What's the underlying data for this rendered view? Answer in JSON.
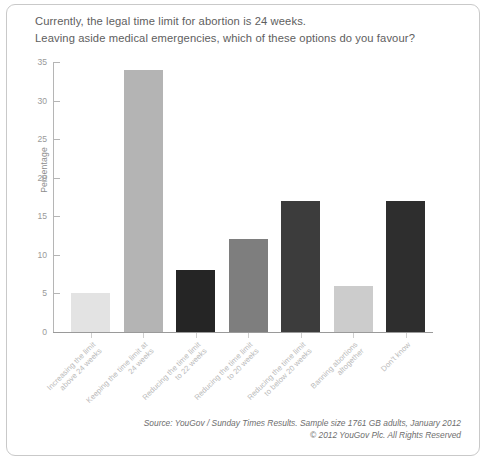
{
  "question": {
    "line1": "Currently, the legal time limit for abortion is 24 weeks.",
    "line2": "Leaving aside medical emergencies, which of these options do you favour?"
  },
  "footer": {
    "source": "Source: YouGov / Sunday Times Results. Sample size 1761 GB adults, January 2012",
    "copyright": "© 2012 YouGov Plc. All Rights Reserved"
  },
  "chart_data": {
    "type": "bar",
    "title": "Currently, the legal time limit for abortion is 24 weeks. Leaving aside medical emergencies, which of these options do you favour?",
    "xlabel": "",
    "ylabel": "Percentage",
    "ylim": [
      0,
      35
    ],
    "yticks": [
      0,
      5,
      10,
      15,
      20,
      25,
      30,
      35
    ],
    "ytick_labels": [
      "0",
      "5",
      "10",
      "15",
      "20",
      "25",
      "30",
      "35"
    ],
    "grid": false,
    "legend": "none",
    "categories": [
      "Increasing the limit above 24 weeks",
      "Keeping the time limit at 24 weeks",
      "Reducing the time limit to 22 weeks",
      "Reducing the time limit to 20 weeks",
      "Reducing the time limit to below 20 weeks",
      "Banning abortions altogether",
      "Don't know"
    ],
    "values": [
      5,
      34,
      8,
      12,
      17,
      6,
      17
    ],
    "bar_colors": [
      "#e3e3e3",
      "#b4b4b4",
      "#252525",
      "#7e7e7e",
      "#3c3c3c",
      "#cccccc",
      "#2e2e2e"
    ],
    "axis_color": "#9a9a9a",
    "tick_label_color": "#9a9a9a",
    "category_label_color": "#b9b9b9"
  }
}
